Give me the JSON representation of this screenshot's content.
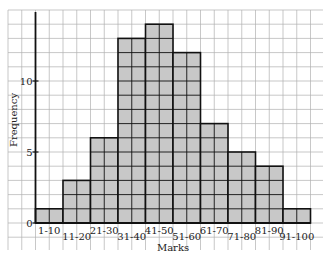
{
  "chart_data": {
    "type": "bar",
    "title": "",
    "xlabel": "Marks",
    "ylabel": "Frequency",
    "categories": [
      "1-10",
      "11-20",
      "21-30",
      "31-40",
      "41-50",
      "51-60",
      "61-70",
      "71-80",
      "81-90",
      "91-100"
    ],
    "values": [
      1,
      3,
      6,
      13,
      14,
      12,
      7,
      5,
      4,
      1
    ],
    "ylim": [
      0,
      15
    ],
    "yticks": [
      0,
      5,
      10
    ],
    "grid": true,
    "bar_color": "#c8c8c8",
    "edge_color": "#111111",
    "grid_color": "#b0b0b0"
  }
}
